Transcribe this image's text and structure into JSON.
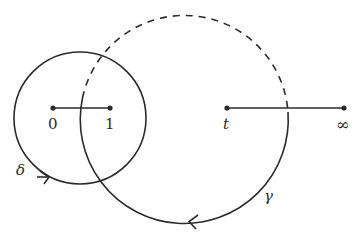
{
  "diagram": {
    "type": "contour-diagram",
    "colors": {
      "stroke": "#2b2b2b",
      "background": "#ffffff"
    },
    "points": [
      {
        "id": "p0",
        "label": "0",
        "x": 53,
        "y": 108
      },
      {
        "id": "p1",
        "label": "1",
        "x": 110,
        "y": 108
      },
      {
        "id": "pt",
        "label": "t",
        "x": 227,
        "y": 108
      },
      {
        "id": "pinf",
        "label": "∞",
        "x": 344,
        "y": 108
      }
    ],
    "segments": [
      {
        "from": "0",
        "to": "1"
      },
      {
        "from": "t",
        "to": "∞"
      }
    ],
    "curves": [
      {
        "name": "delta",
        "label": "δ",
        "shape": "circle",
        "center": [
          80,
          118
        ],
        "radius": 66,
        "style": "solid",
        "arrow_direction": "right"
      },
      {
        "name": "gamma",
        "label": "γ",
        "shape": "circle",
        "center": [
          184,
          118
        ],
        "radius": 104,
        "style": "solid lower part, dashed upper part",
        "arrow_direction": "left"
      }
    ]
  },
  "labels": {
    "zero": "0",
    "one": "1",
    "t": "t",
    "infinity": "∞",
    "delta": "δ",
    "gamma": "γ"
  }
}
